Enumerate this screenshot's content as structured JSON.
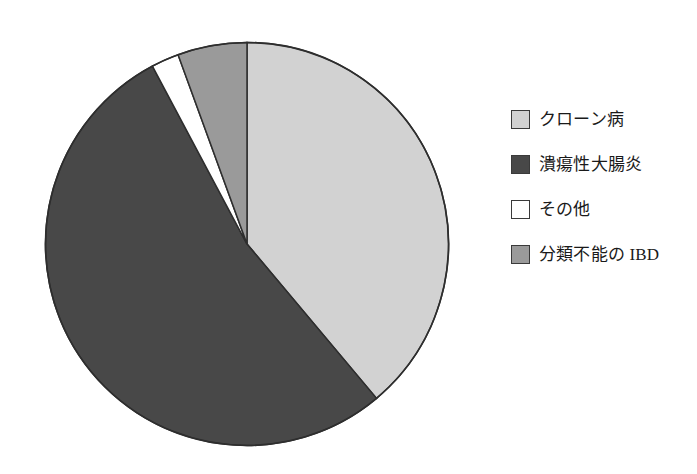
{
  "chart_data": {
    "type": "pie",
    "title": "",
    "subtitle": "",
    "xlabel": "",
    "ylabel": "",
    "legend_position": "right",
    "grid": false,
    "start_angle_deg": 0,
    "direction": "clockwise",
    "categories": [
      "クローン病",
      "潰瘍性大腸炎",
      "その他",
      "分類不能の IBD"
    ],
    "values": [
      38.9,
      53.3,
      2.2,
      5.6
    ],
    "value_unit": "%",
    "colors": [
      "#d2d2d2",
      "#484848",
      "#ffffff",
      "#9a9a9a"
    ],
    "slices": [
      {
        "label": "クローン病",
        "value": 38.9,
        "color": "#d2d2d2",
        "start_deg": 0,
        "end_deg": 140
      },
      {
        "label": "潰瘍性大腸炎",
        "value": 53.3,
        "color": "#484848",
        "start_deg": 140,
        "end_deg": 332
      },
      {
        "label": "その他",
        "value": 2.2,
        "color": "#ffffff",
        "start_deg": 332,
        "end_deg": 340
      },
      {
        "label": "分類不能の IBD",
        "value": 5.6,
        "color": "#9a9a9a",
        "start_deg": 340,
        "end_deg": 360
      }
    ]
  },
  "legend": {
    "items": [
      {
        "label": "クローン病",
        "color": "#d2d2d2"
      },
      {
        "label": "潰瘍性大腸炎",
        "color": "#484848"
      },
      {
        "label": "その他",
        "color": "#ffffff"
      },
      {
        "label": "分類不能の IBD",
        "color": "#9a9a9a"
      }
    ]
  },
  "style": {
    "outline_color": "#2e2e2e",
    "background": "#ffffff"
  }
}
